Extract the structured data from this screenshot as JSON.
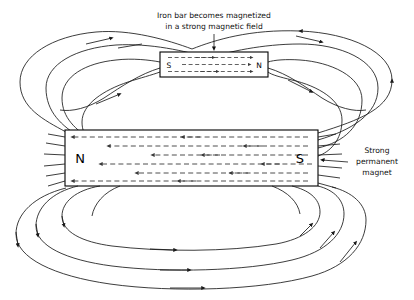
{
  "figure": {
    "type": "physics-diagram",
    "background_color": "#ffffff",
    "line_color": "#1a1a1a",
    "width": 414,
    "height": 300
  },
  "caption": {
    "line1": "Iron bar becomes magnetized",
    "line2": "in a strong magnetic field",
    "pointer": "down-arrow"
  },
  "iron_bar": {
    "label_left": "S",
    "label_right": "N",
    "internal_arrow_direction": "right",
    "internal_rows": 3,
    "x": 160,
    "y": 52,
    "width": 108,
    "height": 25
  },
  "permanent_magnet": {
    "label_left": "N",
    "label_right": "S",
    "internal_arrow_direction": "left",
    "internal_rows": 6,
    "x": 65,
    "y": 130,
    "width": 253,
    "height": 56
  },
  "side_label": {
    "line1": "Strong",
    "line2": "permanent",
    "line3": "magnet",
    "leader": "line-to-magnet-right-edge"
  },
  "field_lines": {
    "count": 8,
    "direction": "clockwise",
    "arrow_marker": "filled-triangle",
    "description": "Lines exit the S pole region, loop over the top through the iron bar, and return below around the N pole"
  }
}
